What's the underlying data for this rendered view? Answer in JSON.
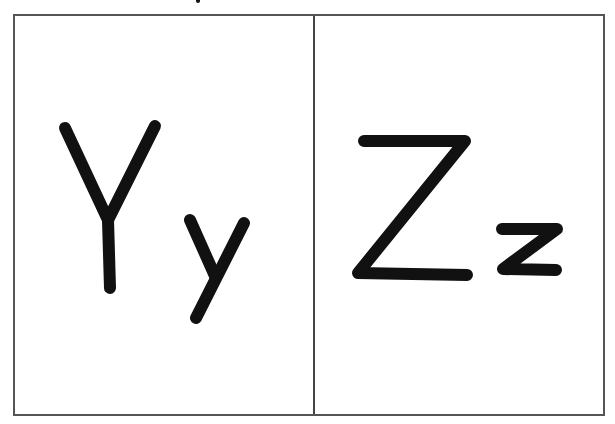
{
  "cards": [
    {
      "id": "Y",
      "uppercase": "Y",
      "lowercase": "y",
      "label": "Yy"
    },
    {
      "id": "Z",
      "uppercase": "Z",
      "lowercase": "z",
      "label": "Zz"
    }
  ],
  "colors": {
    "ink": "#111111",
    "border": "#555555",
    "background": "#ffffff"
  }
}
